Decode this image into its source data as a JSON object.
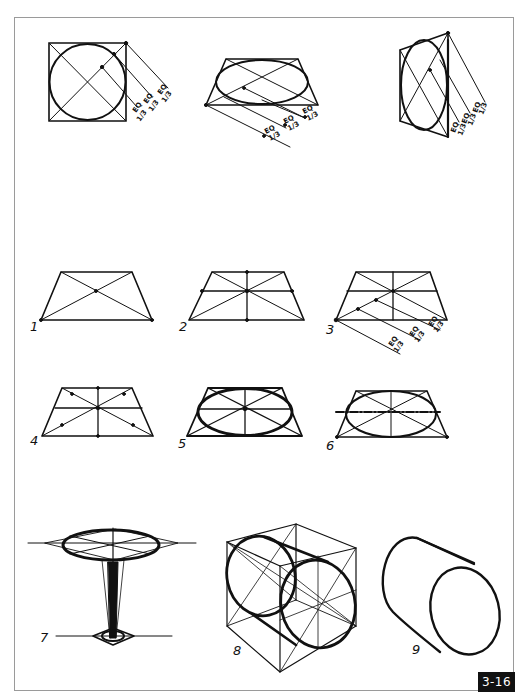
{
  "page": {
    "figure_number": "3-16",
    "colors": {
      "ink": "#111111",
      "frame": "#9a9a9a",
      "background": "#ffffff",
      "badge_bg": "#111111",
      "badge_text": "#ffffff"
    }
  },
  "top_row": {
    "figures": [
      {
        "name": "square-circle-front",
        "eq_labels": [
          "EQ 1/3",
          "EQ 1/3",
          "EQ 1/3"
        ]
      },
      {
        "name": "square-circle-horizontal-plane",
        "eq_labels": [
          "EQ 1/3",
          "EQ 1/3",
          "EQ 1/3"
        ]
      },
      {
        "name": "square-circle-vertical-plane",
        "eq_labels": [
          "EQ 1/3",
          "EQ 1/3",
          "EQ 1/3"
        ]
      }
    ],
    "eq_text": "EQ",
    "third_text": "1/3"
  },
  "steps": [
    {
      "number": "1",
      "description": "Trapezoid with diagonals"
    },
    {
      "number": "2",
      "description": "Center lines through diagonal intersection"
    },
    {
      "number": "3",
      "description": "Diagonal divided into equal thirds",
      "eq_labels": [
        "EQ 1/3",
        "EQ 1/3",
        "EQ 1/3"
      ]
    },
    {
      "number": "4",
      "description": "Tangent points marked on diagonals"
    },
    {
      "number": "5",
      "description": "Ellipse drawn through points"
    },
    {
      "number": "6",
      "description": "Ellipse with major axis dashed"
    },
    {
      "number": "7",
      "description": "Table: ellipse top on stem with base"
    },
    {
      "number": "8",
      "description": "Cube with circles on two faces"
    },
    {
      "number": "9",
      "description": "Cylinder"
    }
  ]
}
